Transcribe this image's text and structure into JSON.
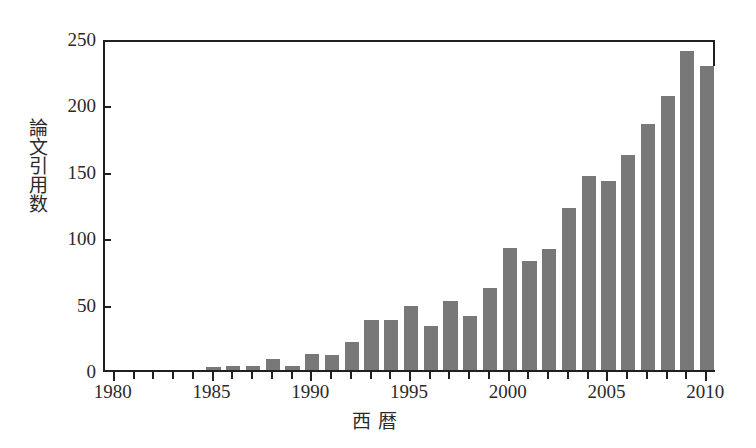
{
  "chart_data": {
    "type": "bar",
    "title": "",
    "xlabel": "西暦",
    "ylabel": "論文引用数",
    "xlim": [
      1979.5,
      2010.5
    ],
    "ylim": [
      0,
      250
    ],
    "yticks": [
      0,
      50,
      100,
      150,
      200,
      250
    ],
    "xticks": [
      1980,
      1985,
      1990,
      1995,
      2000,
      2005,
      2010
    ],
    "xtick_labels": [
      "1980",
      "1985",
      "1990",
      "1995",
      "2000",
      "2005",
      "2010"
    ],
    "ytick_labels": [
      "0",
      "50",
      "100",
      "150",
      "200",
      "250"
    ],
    "grid": false,
    "legend": null,
    "bar_color": "#787878",
    "axis_color": "#202020",
    "categories": [
      1980,
      1981,
      1982,
      1983,
      1984,
      1985,
      1986,
      1987,
      1988,
      1989,
      1990,
      1991,
      1992,
      1993,
      1994,
      1995,
      1996,
      1997,
      1998,
      1999,
      2000,
      2001,
      2002,
      2003,
      2004,
      2005,
      2006,
      2007,
      2008,
      2009,
      2010
    ],
    "values": [
      0,
      0,
      0,
      0,
      0,
      2,
      3,
      3,
      8,
      3,
      12,
      11,
      21,
      38,
      38,
      48,
      33,
      52,
      41,
      62,
      92,
      82,
      91,
      122,
      146,
      142,
      162,
      185,
      206,
      240,
      229
    ]
  },
  "axes": {
    "ylabel": "論文引用数",
    "xlabel": "西暦"
  }
}
